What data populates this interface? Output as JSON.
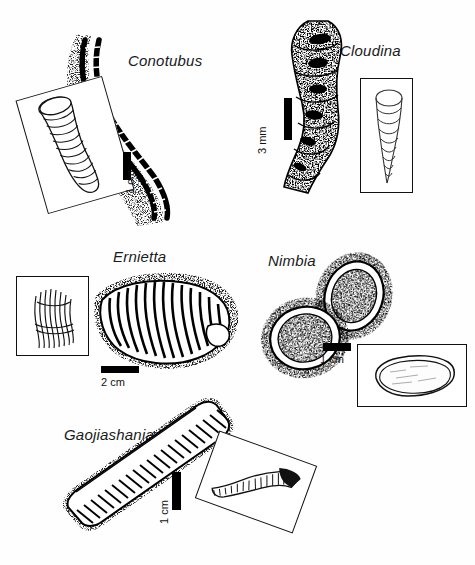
{
  "figure": {
    "background_color": "#fefefe",
    "ink_color": "#000000",
    "label_style": "italic",
    "panel_count": 5
  },
  "panels": [
    {
      "id": "conotubus",
      "taxon": "Conotubus",
      "position": "top-left",
      "specimen_form": "elongate sinuous annulated tube preserved in stippled matrix",
      "inset": {
        "present": true,
        "rotation_deg": -15,
        "content": "line reconstruction of annulated funnel-shaped tube"
      },
      "scale": {
        "length_label": "1 cm",
        "orientation": "vertical"
      }
    },
    {
      "id": "cloudina",
      "taxon": "Cloudina",
      "position": "top-right",
      "specimen_form": "stacked irregular nested cones, heavily stippled",
      "inset": {
        "present": true,
        "rotation_deg": 0,
        "content": "line reconstruction of nested funnel-in-funnel tube"
      },
      "scale": {
        "length_label": "3 mm",
        "orientation": "vertical"
      }
    },
    {
      "id": "ernietta",
      "taxon": "Ernietta",
      "position": "middle-left",
      "specimen_form": "broad sac-shaped body with parallel vertical ribbed tubes",
      "inset": {
        "present": true,
        "rotation_deg": 0,
        "content": "line reconstruction of double-walled ribbed sac"
      },
      "scale": {
        "length_label": "2 cm",
        "orientation": "horizontal"
      }
    },
    {
      "id": "nimbia",
      "taxon": "Nimbia",
      "position": "middle-right",
      "specimen_form": "two overlapping discoidal impressions with raised rims",
      "inset": {
        "present": true,
        "rotation_deg": 0,
        "content": "line drawing of irregular discoidal outline with rim"
      },
      "scale": {
        "length_label": "1 cm",
        "orientation": "horizontal"
      }
    },
    {
      "id": "gaojiashania",
      "taxon": "Gaojiashania",
      "position": "bottom-left",
      "specimen_form": "long straight densely annulated ribbon-like tube",
      "inset": {
        "present": true,
        "rotation_deg": 20,
        "content": "line reconstruction of closely annulated tapering tube"
      },
      "scale": {
        "length_label": "1 cm",
        "orientation": "vertical"
      }
    }
  ]
}
